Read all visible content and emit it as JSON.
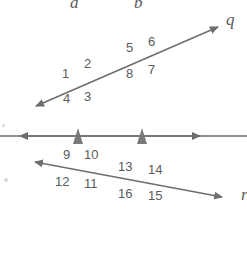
{
  "figure": {
    "type": "geometry-diagram",
    "width": 247,
    "height": 270,
    "background_color": "#ffffff",
    "stroke_color": "#6e6e6e",
    "label_color": "#5a5a5a"
  },
  "lines": {
    "vertical": [
      {
        "name": "a",
        "label": "a",
        "x": 78,
        "y_top": 12,
        "y_bottom": 260,
        "has_top_arrow": true,
        "has_bottom_arrow": true,
        "parallel_tick": "single-arrowhead",
        "tick_y": 138
      },
      {
        "name": "b",
        "label": "b",
        "x": 142,
        "y_top": 12,
        "y_bottom": 260,
        "has_top_arrow": true,
        "has_bottom_arrow": true,
        "parallel_tick": "single-arrowhead",
        "tick_y": 138
      }
    ],
    "transversals": [
      {
        "name": "q",
        "label": "q",
        "x1": 34,
        "y1": 107,
        "x2": 220,
        "y2": 26,
        "has_start_arrow": true,
        "has_end_arrow": true,
        "direction": "rising-right"
      },
      {
        "name": "r",
        "label": "",
        "x1": 33,
        "y1": 162,
        "x2": 224,
        "y2": 198,
        "has_start_arrow": true,
        "has_end_arrow": true,
        "direction": "falling-right"
      }
    ]
  },
  "intersections": [
    {
      "id": "a-q",
      "lines": [
        "a",
        "q"
      ],
      "x": 78,
      "y": 88,
      "angles": {
        "upper_left": "1",
        "upper_right": "2",
        "lower_right": "3",
        "lower_left": "4"
      }
    },
    {
      "id": "b-q",
      "lines": [
        "b",
        "q"
      ],
      "x": 142,
      "y": 61,
      "angles": {
        "upper_left": "5",
        "upper_right": "6",
        "lower_right": "7",
        "lower_left": "8"
      }
    },
    {
      "id": "a-r",
      "lines": [
        "a",
        "r"
      ],
      "x": 78,
      "y": 170,
      "angles": {
        "upper_left": "9",
        "upper_right": "10",
        "lower_right": "11",
        "lower_left": "12"
      }
    },
    {
      "id": "b-r",
      "lines": [
        "b",
        "r"
      ],
      "x": 142,
      "y": 182,
      "angles": {
        "upper_left": "13",
        "upper_right": "14",
        "lower_right": "15",
        "lower_left": "16"
      }
    }
  ],
  "angle_labels": [
    {
      "text": "1",
      "x": 62,
      "y": 73
    },
    {
      "text": "2",
      "x": 84,
      "y": 62
    },
    {
      "text": "3",
      "x": 84,
      "y": 95
    },
    {
      "text": "4",
      "x": 62,
      "y": 97
    },
    {
      "text": "5",
      "x": 126,
      "y": 45
    },
    {
      "text": "6",
      "x": 148,
      "y": 39
    },
    {
      "text": "7",
      "x": 148,
      "y": 68
    },
    {
      "text": "8",
      "x": 126,
      "y": 72
    },
    {
      "text": "9",
      "x": 62,
      "y": 153
    },
    {
      "text": "10",
      "x": 84,
      "y": 153
    },
    {
      "text": "11",
      "x": 84,
      "y": 182
    },
    {
      "text": "12",
      "x": 57,
      "y": 180
    },
    {
      "text": "13",
      "x": 118,
      "y": 165
    },
    {
      "text": "14",
      "x": 148,
      "y": 168
    },
    {
      "text": "15",
      "x": 148,
      "y": 194
    },
    {
      "text": "16",
      "x": 118,
      "y": 192
    }
  ],
  "line_labels": [
    {
      "text": "a",
      "x": 70,
      "y": -4
    },
    {
      "text": "b",
      "x": 134,
      "y": -4
    },
    {
      "text": "q",
      "x": 226,
      "y": 12
    },
    {
      "text": "r",
      "x": 240,
      "y": 188
    }
  ]
}
